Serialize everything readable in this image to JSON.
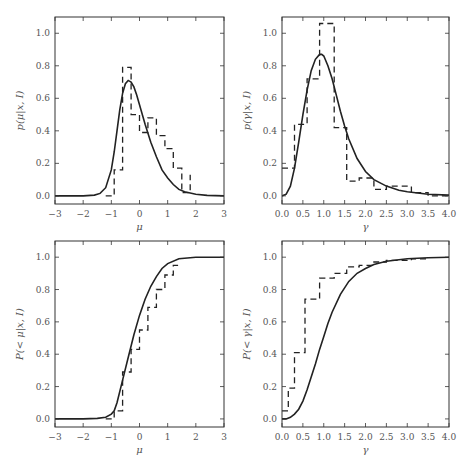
{
  "figure": {
    "background": "#ffffff",
    "line_color": "#222222",
    "axis_color": "#333333"
  },
  "chart_data": [
    {
      "id": "top-left",
      "type": "line",
      "title": "",
      "xlabel": "μ",
      "ylabel": "p(μ|x, I)",
      "xlim": [
        -3,
        3
      ],
      "ylim": [
        -0.05,
        1.1
      ],
      "xticks": [
        -3,
        -2,
        -1,
        0,
        1,
        2,
        3
      ],
      "xtick_labels": [
        "−3",
        "−2",
        "−1",
        "0",
        "1",
        "2",
        "3"
      ],
      "yticks": [
        0.0,
        0.2,
        0.4,
        0.6,
        0.8,
        1.0
      ],
      "ytick_labels": [
        "0.0",
        "0.2",
        "0.4",
        "0.6",
        "0.8",
        "1.0"
      ],
      "grid": false,
      "series": [
        {
          "name": "analytic posterior",
          "style": "solid",
          "x": [
            -3.0,
            -2.0,
            -1.6,
            -1.4,
            -1.2,
            -1.0,
            -0.9,
            -0.8,
            -0.7,
            -0.6,
            -0.5,
            -0.4,
            -0.3,
            -0.2,
            -0.1,
            0.0,
            0.2,
            0.4,
            0.6,
            0.8,
            1.0,
            1.2,
            1.4,
            1.6,
            2.0,
            2.4,
            3.0
          ],
          "y": [
            0.0,
            0.0,
            0.005,
            0.015,
            0.05,
            0.16,
            0.27,
            0.4,
            0.53,
            0.63,
            0.69,
            0.71,
            0.7,
            0.67,
            0.62,
            0.56,
            0.44,
            0.33,
            0.24,
            0.16,
            0.11,
            0.07,
            0.04,
            0.025,
            0.01,
            0.003,
            0.0
          ]
        },
        {
          "name": "histogram",
          "style": "dashed-step",
          "bin_edges": [
            -1.2,
            -0.9,
            -0.6,
            -0.3,
            0.0,
            0.3,
            0.6,
            0.9,
            1.2,
            1.5,
            1.8
          ],
          "values": [
            0.0,
            0.16,
            0.79,
            0.5,
            0.39,
            0.48,
            0.37,
            0.29,
            0.17,
            0.02,
            0.13
          ]
        }
      ]
    },
    {
      "id": "top-right",
      "type": "line",
      "title": "",
      "xlabel": "γ",
      "ylabel": "p(γ|x, I)",
      "xlim": [
        0.0,
        4.0
      ],
      "ylim": [
        -0.05,
        1.1
      ],
      "xticks": [
        0.0,
        0.5,
        1.0,
        1.5,
        2.0,
        2.5,
        3.0,
        3.5,
        4.0
      ],
      "xtick_labels": [
        "0.0",
        "0.5",
        "1.0",
        "1.5",
        "2.0",
        "2.5",
        "3.0",
        "3.5",
        "4.0"
      ],
      "yticks": [
        0.0,
        0.2,
        0.4,
        0.6,
        0.8,
        1.0
      ],
      "ytick_labels": [
        "0.0",
        "0.2",
        "0.4",
        "0.6",
        "0.8",
        "1.0"
      ],
      "grid": false,
      "series": [
        {
          "name": "analytic posterior",
          "style": "solid",
          "x": [
            0.0,
            0.1,
            0.2,
            0.3,
            0.4,
            0.5,
            0.6,
            0.7,
            0.8,
            0.9,
            0.95,
            1.0,
            1.1,
            1.2,
            1.3,
            1.4,
            1.5,
            1.6,
            1.8,
            2.0,
            2.2,
            2.5,
            2.8,
            3.0,
            3.5,
            4.0
          ],
          "y": [
            0.0,
            0.01,
            0.06,
            0.17,
            0.33,
            0.5,
            0.65,
            0.77,
            0.84,
            0.87,
            0.87,
            0.86,
            0.8,
            0.72,
            0.62,
            0.52,
            0.43,
            0.35,
            0.23,
            0.15,
            0.1,
            0.06,
            0.035,
            0.025,
            0.01,
            0.005
          ]
        },
        {
          "name": "histogram",
          "style": "dashed-step",
          "bin_edges": [
            0.0,
            0.3,
            0.6,
            0.9,
            1.25,
            1.55,
            1.85,
            2.2,
            2.5,
            3.1,
            3.5,
            4.0
          ],
          "values": [
            0.17,
            0.44,
            0.72,
            1.06,
            0.42,
            0.09,
            0.11,
            0.04,
            0.06,
            0.02,
            0.0
          ]
        }
      ]
    },
    {
      "id": "bottom-left",
      "type": "line",
      "title": "",
      "xlabel": "μ",
      "ylabel": "P(< μ|x, I)",
      "xlim": [
        -3,
        3
      ],
      "ylim": [
        -0.05,
        1.1
      ],
      "xticks": [
        -3,
        -2,
        -1,
        0,
        1,
        2,
        3
      ],
      "xtick_labels": [
        "−3",
        "−2",
        "−1",
        "0",
        "1",
        "2",
        "3"
      ],
      "yticks": [
        0.0,
        0.2,
        0.4,
        0.6,
        0.8,
        1.0
      ],
      "ytick_labels": [
        "0.0",
        "0.2",
        "0.4",
        "0.6",
        "0.8",
        "1.0"
      ],
      "grid": false,
      "series": [
        {
          "name": "analytic cumulative",
          "style": "solid",
          "x": [
            -3.0,
            -2.0,
            -1.5,
            -1.2,
            -1.0,
            -0.9,
            -0.8,
            -0.6,
            -0.4,
            -0.2,
            0.0,
            0.2,
            0.4,
            0.6,
            0.8,
            1.0,
            1.4,
            2.0,
            3.0
          ],
          "y": [
            0.0,
            0.0,
            0.003,
            0.01,
            0.03,
            0.05,
            0.1,
            0.24,
            0.38,
            0.52,
            0.64,
            0.74,
            0.82,
            0.88,
            0.93,
            0.96,
            0.99,
            1.0,
            1.0
          ]
        },
        {
          "name": "empirical cumulative",
          "style": "dashed-step",
          "bin_edges": [
            -1.2,
            -0.9,
            -0.6,
            -0.3,
            0.0,
            0.3,
            0.6,
            0.9,
            1.2,
            1.5
          ],
          "values": [
            0.0,
            0.05,
            0.29,
            0.43,
            0.55,
            0.69,
            0.8,
            0.89,
            0.95,
            0.95
          ]
        }
      ]
    },
    {
      "id": "bottom-right",
      "type": "line",
      "title": "",
      "xlabel": "γ",
      "ylabel": "P(< γ|x, I)",
      "xlim": [
        0.0,
        4.0
      ],
      "ylim": [
        -0.05,
        1.1
      ],
      "xticks": [
        0.0,
        0.5,
        1.0,
        1.5,
        2.0,
        2.5,
        3.0,
        3.5,
        4.0
      ],
      "xtick_labels": [
        "0.0",
        "0.5",
        "1.0",
        "1.5",
        "2.0",
        "2.5",
        "3.0",
        "3.5",
        "4.0"
      ],
      "yticks": [
        0.0,
        0.2,
        0.4,
        0.6,
        0.8,
        1.0
      ],
      "ytick_labels": [
        "0.0",
        "0.2",
        "0.4",
        "0.6",
        "0.8",
        "1.0"
      ],
      "grid": false,
      "series": [
        {
          "name": "analytic cumulative",
          "style": "solid",
          "x": [
            0.0,
            0.1,
            0.2,
            0.3,
            0.4,
            0.5,
            0.6,
            0.7,
            0.8,
            0.9,
            1.0,
            1.1,
            1.2,
            1.4,
            1.6,
            1.8,
            2.0,
            2.2,
            2.5,
            3.0,
            3.5,
            4.0
          ],
          "y": [
            0.0,
            0.0,
            0.01,
            0.03,
            0.06,
            0.11,
            0.18,
            0.26,
            0.34,
            0.43,
            0.51,
            0.59,
            0.66,
            0.77,
            0.85,
            0.9,
            0.93,
            0.955,
            0.975,
            0.99,
            0.997,
            1.0
          ]
        },
        {
          "name": "empirical cumulative",
          "style": "dashed-step",
          "bin_edges": [
            0.0,
            0.15,
            0.3,
            0.55,
            0.9,
            1.25,
            1.55,
            1.85,
            2.2,
            2.5,
            3.1,
            3.5
          ],
          "values": [
            0.05,
            0.19,
            0.41,
            0.74,
            0.87,
            0.9,
            0.94,
            0.95,
            0.97,
            0.98,
            0.99
          ]
        }
      ]
    }
  ]
}
